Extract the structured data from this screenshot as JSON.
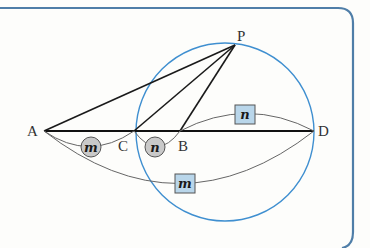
{
  "diagram": {
    "colors": {
      "frame": "#4f7ea8",
      "circle": "#3f8fd0",
      "segment": "#1a1a1a",
      "arc": "#666666",
      "circle_badge_fill": "#c9c9c9",
      "box_badge_fill": "#b9d6ea",
      "background": "#fdfdfb"
    },
    "points": {
      "A": {
        "label": "A",
        "x": 44,
        "y": 131
      },
      "C": {
        "label": "C",
        "x": 134,
        "y": 131
      },
      "B": {
        "label": "B",
        "x": 180,
        "y": 131
      },
      "D": {
        "label": "D",
        "x": 314,
        "y": 131
      },
      "P": {
        "label": "P",
        "x": 235,
        "y": 45
      }
    },
    "segments": [
      {
        "from": "A",
        "to": "D"
      },
      {
        "from": "A",
        "to": "P"
      },
      {
        "from": "C",
        "to": "P"
      },
      {
        "from": "B",
        "to": "P"
      }
    ],
    "circle": {
      "cx": 225,
      "cy": 132,
      "r": 89
    },
    "badges": {
      "m_circle": {
        "text": "m",
        "shape": "circle",
        "between": [
          "A",
          "C"
        ]
      },
      "n_circle": {
        "text": "n",
        "shape": "circle",
        "between": [
          "C",
          "B"
        ]
      },
      "n_box": {
        "text": "n",
        "shape": "box",
        "between": [
          "B",
          "D"
        ]
      },
      "m_box": {
        "text": "m",
        "shape": "box",
        "between": [
          "A",
          "D"
        ]
      }
    }
  }
}
